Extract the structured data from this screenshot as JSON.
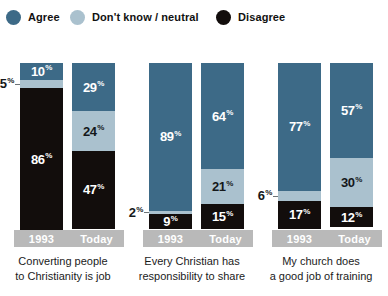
{
  "legend": {
    "items": [
      {
        "label": "Agree",
        "color": "#3d6a87",
        "icon": "circle-swatch-icon"
      },
      {
        "label": "Don't know / neutral",
        "color": "#aac1ce",
        "icon": "circle-swatch-icon"
      },
      {
        "label": "Disagree",
        "color": "#120d0c",
        "icon": "circle-swatch-icon"
      }
    ]
  },
  "chart_data": {
    "type": "bar",
    "subtype": "stacked-100-percent",
    "title": "",
    "xlabel": "",
    "ylabel": "",
    "ylim": [
      0,
      100
    ],
    "grid": false,
    "legend_position": "top-left",
    "categories": [
      "1993",
      "Today"
    ],
    "series": [
      {
        "name": "Agree",
        "color": "#3d6a87"
      },
      {
        "name": "Don't know / neutral",
        "color": "#aac1ce"
      },
      {
        "name": "Disagree",
        "color": "#120d0c"
      }
    ],
    "groups": [
      {
        "caption_lines": [
          "Converting people",
          "to Christianity is job"
        ],
        "bars": [
          {
            "category": "1993",
            "segments": [
              {
                "series": "Agree",
                "value": 10,
                "label": "10",
                "outside": false
              },
              {
                "series": "Don't know / neutral",
                "value": 5,
                "label": "5",
                "outside": true
              },
              {
                "series": "Disagree",
                "value": 86,
                "label": "86",
                "outside": false
              }
            ]
          },
          {
            "category": "Today",
            "segments": [
              {
                "series": "Agree",
                "value": 29,
                "label": "29",
                "outside": false
              },
              {
                "series": "Don't know / neutral",
                "value": 24,
                "label": "24",
                "outside": false
              },
              {
                "series": "Disagree",
                "value": 47,
                "label": "47",
                "outside": false
              }
            ]
          }
        ]
      },
      {
        "caption_lines": [
          "Every Christian has",
          "responsibility to share"
        ],
        "bars": [
          {
            "category": "1993",
            "segments": [
              {
                "series": "Agree",
                "value": 89,
                "label": "89",
                "outside": false
              },
              {
                "series": "Don't know / neutral",
                "value": 2,
                "label": "2",
                "outside": true
              },
              {
                "series": "Disagree",
                "value": 9,
                "label": "9",
                "outside": false
              }
            ]
          },
          {
            "category": "Today",
            "segments": [
              {
                "series": "Agree",
                "value": 64,
                "label": "64",
                "outside": false
              },
              {
                "series": "Don't know / neutral",
                "value": 21,
                "label": "21",
                "outside": false
              },
              {
                "series": "Disagree",
                "value": 15,
                "label": "15",
                "outside": false
              }
            ]
          }
        ]
      },
      {
        "caption_lines": [
          "My church does",
          "a good job of training"
        ],
        "bars": [
          {
            "category": "1993",
            "segments": [
              {
                "series": "Agree",
                "value": 77,
                "label": "77",
                "outside": false
              },
              {
                "series": "Don't know / neutral",
                "value": 6,
                "label": "6",
                "outside": true
              },
              {
                "series": "Disagree",
                "value": 17,
                "label": "17",
                "outside": false
              }
            ]
          },
          {
            "category": "Today",
            "segments": [
              {
                "series": "Agree",
                "value": 57,
                "label": "57",
                "outside": false
              },
              {
                "series": "Don't know / neutral",
                "value": 30,
                "label": "30",
                "outside": false
              },
              {
                "series": "Disagree",
                "value": 12,
                "label": "12",
                "outside": false
              }
            ]
          }
        ]
      }
    ],
    "value_suffix": "%"
  }
}
